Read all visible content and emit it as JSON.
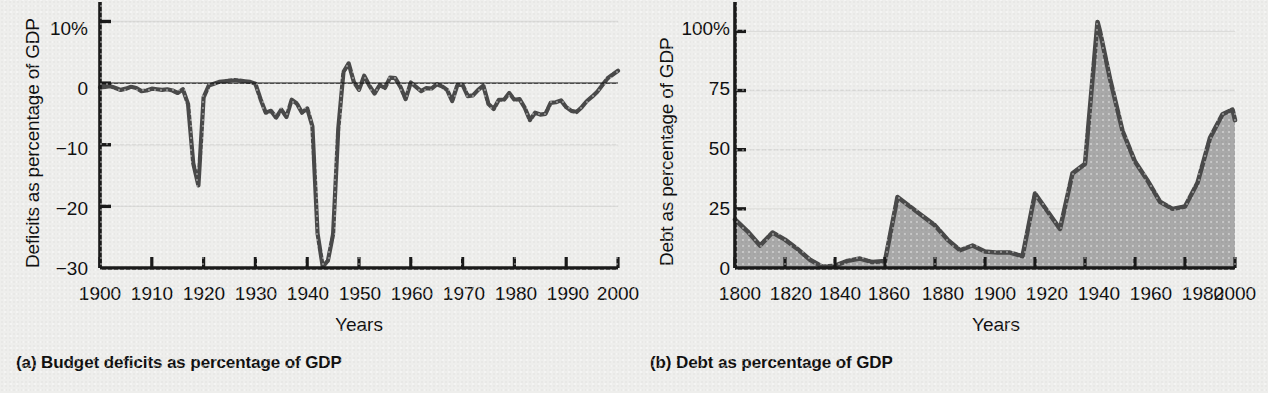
{
  "figure": {
    "background_color": "#eeeeec",
    "ink_color": "#1a1a1a",
    "series_line_color": "#4a4a4a",
    "series_fill_color": "#a9a9a9"
  },
  "panel_a": {
    "caption": "(a) Budget deficits as percentage of GDP",
    "ylabel": "Deficits as percentage of GDP",
    "xlabel": "Years",
    "ytick_labels": [
      "10%",
      "0",
      "−10",
      "−20",
      "−30"
    ],
    "xtick_labels": [
      "1900",
      "1910",
      "1920",
      "1930",
      "1940",
      "1950",
      "1960",
      "1970",
      "1980",
      "1990",
      "2000"
    ]
  },
  "panel_b": {
    "caption": "(b) Debt as percentage of GDP",
    "ylabel": "Debt as percentage of GDP",
    "xlabel": "Years",
    "ytick_labels": [
      "100%",
      "75",
      "50",
      "25",
      "0"
    ],
    "xtick_labels": [
      "1800",
      "1820",
      "1840",
      "1860",
      "1880",
      "1900",
      "1920",
      "1940",
      "1960",
      "1980",
      "2000"
    ]
  },
  "chart_data": [
    {
      "id": "panel_a",
      "type": "line",
      "title": "(a) Budget deficits as percentage of GDP",
      "xlabel": "Years",
      "ylabel": "Deficits as percentage of GDP",
      "xlim": [
        1900,
        2000
      ],
      "ylim": [
        -30,
        13
      ],
      "yticks": [
        10,
        0,
        -10,
        -20,
        -30
      ],
      "ytick_labels": [
        "10%",
        "0",
        "−10",
        "−20",
        "−30"
      ],
      "xticks": [
        1900,
        1910,
        1920,
        1930,
        1940,
        1950,
        1960,
        1970,
        1980,
        1990,
        2000
      ],
      "grid": "horizontal-faint",
      "legend": "none",
      "zero_line": true,
      "series": [
        {
          "name": "Federal budget surplus/deficit as % of GDP",
          "x": [
            1900,
            1901,
            1902,
            1903,
            1904,
            1905,
            1906,
            1907,
            1908,
            1909,
            1910,
            1911,
            1912,
            1913,
            1914,
            1915,
            1916,
            1917,
            1918,
            1919,
            1920,
            1921,
            1922,
            1923,
            1924,
            1925,
            1926,
            1927,
            1928,
            1929,
            1930,
            1931,
            1932,
            1933,
            1934,
            1935,
            1936,
            1937,
            1938,
            1939,
            1940,
            1941,
            1942,
            1943,
            1944,
            1945,
            1946,
            1947,
            1948,
            1949,
            1950,
            1951,
            1952,
            1953,
            1954,
            1955,
            1956,
            1957,
            1958,
            1959,
            1960,
            1961,
            1962,
            1963,
            1964,
            1965,
            1966,
            1967,
            1968,
            1969,
            1970,
            1971,
            1972,
            1973,
            1974,
            1975,
            1976,
            1977,
            1978,
            1979,
            1980,
            1981,
            1982,
            1983,
            1984,
            1985,
            1986,
            1987,
            1988,
            1989,
            1990,
            1991,
            1992,
            1993,
            1994,
            1995,
            1996,
            1997,
            1998,
            1999,
            2000
          ],
          "y": [
            -0.7,
            -0.6,
            -0.5,
            -0.8,
            -1.1,
            -0.9,
            -0.6,
            -0.8,
            -1.3,
            -1.2,
            -0.9,
            -1.0,
            -1.1,
            -1.0,
            -1.2,
            -1.6,
            -1.0,
            -3.4,
            -13.0,
            -16.6,
            -2.3,
            -0.4,
            -0.1,
            0.2,
            0.3,
            0.4,
            0.5,
            0.4,
            0.3,
            0.2,
            -0.1,
            -2.6,
            -4.8,
            -4.5,
            -5.6,
            -4.3,
            -5.5,
            -2.7,
            -3.3,
            -4.8,
            -4.1,
            -7.0,
            -24.4,
            -29.8,
            -28.8,
            -24.5,
            -7.4,
            1.8,
            3.2,
            0.2,
            -1.1,
            1.2,
            -0.4,
            -1.7,
            -0.3,
            -0.8,
            0.9,
            0.8,
            -0.6,
            -2.6,
            0.1,
            -0.6,
            -1.3,
            -0.8,
            -0.9,
            -0.2,
            -0.5,
            -1.1,
            -2.9,
            -0.3,
            -0.3,
            -2.1,
            -2.0,
            -1.1,
            -0.4,
            -3.4,
            -4.2,
            -2.7,
            -2.7,
            -1.6,
            -2.7,
            -2.6,
            -4.0,
            -6.0,
            -4.8,
            -5.1,
            -5.0,
            -3.2,
            -3.1,
            -2.8,
            -3.9,
            -4.5,
            -4.7,
            -3.9,
            -2.9,
            -2.2,
            -1.4,
            -0.3,
            0.8,
            1.4,
            2.0
          ],
          "annotations": [
            {
              "label": "World War I deficit peak",
              "x": 1919,
              "y": -16.6
            },
            {
              "label": "World War II deficit peak",
              "x": 1943,
              "y": -29.8
            },
            {
              "label": "Late-1990s surplus",
              "x": 2000,
              "y": 2.0
            }
          ]
        }
      ]
    },
    {
      "id": "panel_b",
      "type": "area",
      "title": "(b) Debt as percentage of GDP",
      "xlabel": "Years",
      "ylabel": "Debt as percentage of GDP",
      "xlim": [
        1800,
        2000
      ],
      "ylim": [
        0,
        112
      ],
      "yticks": [
        100,
        75,
        50,
        25,
        0
      ],
      "ytick_labels": [
        "100%",
        "75",
        "50",
        "25",
        "0"
      ],
      "xticks": [
        1800,
        1820,
        1840,
        1860,
        1880,
        1900,
        1920,
        1940,
        1960,
        1980,
        2000
      ],
      "grid": "horizontal-faint",
      "legend": "none",
      "series": [
        {
          "name": "Federal debt held as % of GDP",
          "x": [
            1800,
            1805,
            1810,
            1815,
            1820,
            1825,
            1830,
            1835,
            1840,
            1845,
            1850,
            1855,
            1860,
            1865,
            1870,
            1875,
            1880,
            1885,
            1890,
            1895,
            1900,
            1905,
            1910,
            1915,
            1920,
            1925,
            1930,
            1935,
            1940,
            1945,
            1946,
            1950,
            1955,
            1960,
            1965,
            1970,
            1975,
            1980,
            1985,
            1990,
            1995,
            1999,
            2000
          ],
          "y": [
            20.5,
            15.5,
            9.5,
            15.0,
            12.0,
            8.0,
            3.5,
            0.5,
            1.0,
            3.0,
            4.0,
            2.5,
            3.0,
            30.0,
            26.0,
            22.0,
            18.0,
            12.0,
            7.5,
            9.5,
            7.0,
            6.5,
            6.5,
            5.0,
            31.5,
            24.0,
            16.5,
            40.0,
            44.0,
            104.0,
            100.0,
            80.0,
            58.0,
            45.0,
            37.0,
            28.0,
            25.0,
            26.0,
            36.0,
            55.0,
            65.0,
            67.0,
            62.5
          ],
          "annotations": [
            {
              "label": "Civil War debt peak",
              "x": 1865,
              "y": 30.0
            },
            {
              "label": "World War I debt peak",
              "x": 1920,
              "y": 31.5
            },
            {
              "label": "World War II debt peak",
              "x": 1945,
              "y": 104.0
            },
            {
              "label": "Post-1980 rise",
              "x": 1999,
              "y": 67.0
            }
          ]
        }
      ]
    }
  ]
}
